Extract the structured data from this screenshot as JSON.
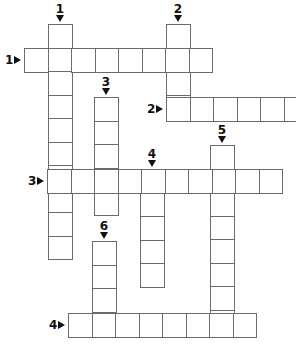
{
  "puzzle": {
    "type": "crossword",
    "cell_size": 23.5,
    "line_color": "#6b6b6b",
    "across": [
      {
        "number": "1",
        "x": 24,
        "y": 48,
        "length": 8
      },
      {
        "number": "2",
        "x": 166,
        "y": 97,
        "length": 6
      },
      {
        "number": "3",
        "x": 47,
        "y": 169,
        "length": 10
      },
      {
        "number": "4",
        "x": 68,
        "y": 313,
        "length": 8
      }
    ],
    "down": [
      {
        "number": "1",
        "x": 48,
        "y": 24,
        "length": 10
      },
      {
        "number": "2",
        "x": 166,
        "y": 24,
        "length": 4
      },
      {
        "number": "3",
        "x": 94,
        "y": 97,
        "length": 5
      },
      {
        "number": "4",
        "x": 140,
        "y": 169,
        "length": 5
      },
      {
        "number": "5",
        "x": 210,
        "y": 145,
        "length": 8
      },
      {
        "number": "6",
        "x": 92,
        "y": 241,
        "length": 4
      }
    ]
  }
}
